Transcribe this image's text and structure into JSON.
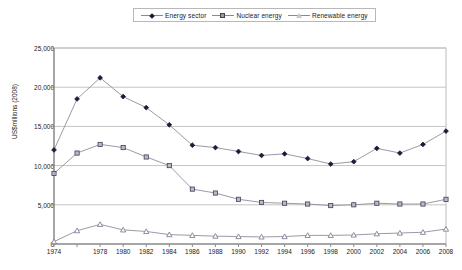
{
  "legend": {
    "position": "top-center",
    "entries": [
      {
        "label": "Energy sector",
        "marker": "diamond-marker",
        "color": "#1b1b38"
      },
      {
        "label": "Nuclear energy",
        "marker": "square-marker",
        "color": "#9a9aa8"
      },
      {
        "label": "Renewable energy",
        "marker": "triangle-marker",
        "color": "#c8c8d0"
      }
    ]
  },
  "axes": {
    "y_title": "US$millions (2008)",
    "y_ticks": [
      "0",
      "5,000",
      "10,000",
      "15,000",
      "20,000",
      "25,000"
    ],
    "x_ticks": [
      "1974",
      "",
      "1978",
      "1980",
      "1982",
      "1984",
      "1986",
      "1988",
      "1990",
      "1992",
      "1994",
      "1996",
      "1998",
      "2000",
      "2002",
      "2004",
      "2006",
      "2008"
    ]
  },
  "chart_data": {
    "type": "line",
    "title": "",
    "subtitle": "",
    "xlabel": "",
    "ylabel": "US$millions (2008)",
    "ylim": [
      0,
      25000
    ],
    "ytick_step": 5000,
    "grid": true,
    "legend_position": "top-center",
    "x": [
      1974,
      1976,
      1978,
      1980,
      1982,
      1984,
      1986,
      1988,
      1990,
      1992,
      1994,
      1996,
      1998,
      2000,
      2002,
      2004,
      2006,
      2008
    ],
    "series": [
      {
        "name": "Energy sector",
        "marker": "diamond",
        "color": "#1b1b38",
        "values": [
          12000,
          18500,
          21200,
          18800,
          17400,
          15200,
          12600,
          12300,
          11800,
          11300,
          11500,
          10900,
          10200,
          10500,
          12200,
          11600,
          12700,
          14400
        ]
      },
      {
        "name": "Nuclear energy",
        "marker": "square",
        "color": "#9a9aa8",
        "values": [
          9000,
          11600,
          12700,
          12300,
          11100,
          10000,
          7000,
          6500,
          5700,
          5300,
          5200,
          5100,
          4900,
          5000,
          5200,
          5100,
          5100,
          5700
        ]
      },
      {
        "name": "Renewable energy",
        "marker": "triangle",
        "color": "#c8c8d0",
        "values": [
          300,
          1700,
          2500,
          1800,
          1600,
          1200,
          1100,
          1000,
          950,
          900,
          950,
          1100,
          1100,
          1150,
          1300,
          1400,
          1500,
          1900
        ]
      }
    ]
  }
}
